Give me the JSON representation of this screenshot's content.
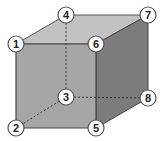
{
  "diagram": {
    "type": "cube-vertex-labels",
    "colors": {
      "top_face": "#c2c2c2",
      "front_face": "#a6a6a6",
      "right_face": "#7c7c7c",
      "edge": "#444444",
      "hidden_edge": "#333333",
      "node_fill": "#ffffff",
      "node_stroke": "#555555"
    },
    "vertices": [
      {
        "id": "v1",
        "label": "1",
        "x": 16,
        "y": 44
      },
      {
        "id": "v2",
        "label": "2",
        "x": 16,
        "y": 128
      },
      {
        "id": "v3",
        "label": "3",
        "x": 66,
        "y": 97
      },
      {
        "id": "v4",
        "label": "4",
        "x": 66,
        "y": 15
      },
      {
        "id": "v5",
        "label": "5",
        "x": 96,
        "y": 128
      },
      {
        "id": "v6",
        "label": "6",
        "x": 96,
        "y": 44
      },
      {
        "id": "v7",
        "label": "7",
        "x": 148,
        "y": 15
      },
      {
        "id": "v8",
        "label": "8",
        "x": 148,
        "y": 98
      }
    ],
    "hidden_edges": [
      [
        "3",
        "4"
      ],
      [
        "3",
        "2"
      ],
      [
        "3",
        "8"
      ]
    ]
  }
}
